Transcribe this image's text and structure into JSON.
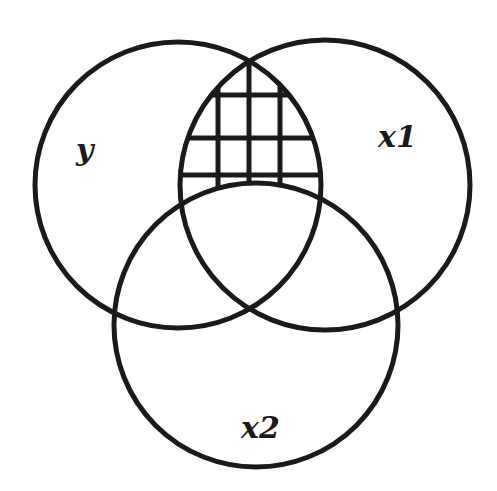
{
  "diagram": {
    "type": "venn",
    "stroke_color": "#1a1a1a",
    "background": "#ffffff",
    "sets": [
      {
        "id": "y",
        "label": "y",
        "cx": 178,
        "cy": 185,
        "r": 143,
        "label_x": 76,
        "label_y": 160
      },
      {
        "id": "x1",
        "label": "x1",
        "cx": 325,
        "cy": 185,
        "r": 145,
        "label_x": 378,
        "label_y": 147
      },
      {
        "id": "x2",
        "label": "x2",
        "cx": 256,
        "cy": 325,
        "r": 142,
        "label_x": 241,
        "label_y": 438
      }
    ],
    "hatched_region": {
      "description": "Intersection of y and x1 excluding x2 (y ∩ x1 ∩ not x2)",
      "pattern": "grid",
      "vertical_lines_x": [
        218,
        249,
        280
      ],
      "horizontal_lines_y": [
        95,
        138,
        175
      ]
    }
  }
}
